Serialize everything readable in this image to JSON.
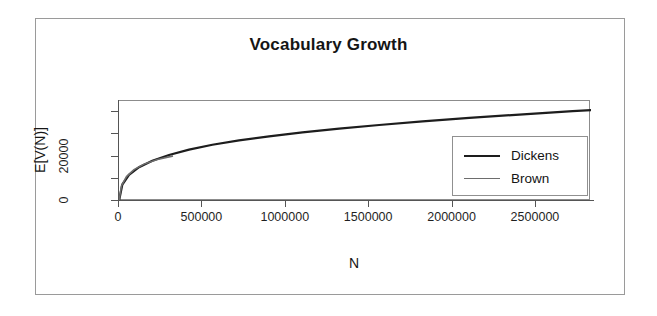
{
  "figure": {
    "title": "Vocabulary Growth",
    "frame_color": "#9a9a9a",
    "background": "#ffffff"
  },
  "chart_data": {
    "type": "line",
    "title": "Vocabulary Growth",
    "xlabel": "N",
    "ylabel": "E[V(N)]",
    "xlim": [
      0,
      2830000
    ],
    "ylim": [
      0,
      45000
    ],
    "grid": false,
    "legend_position": "right",
    "xticks": [
      0,
      500000,
      1000000,
      1500000,
      2000000,
      2500000
    ],
    "xtick_labels": [
      "0",
      "500000",
      "1000000",
      "1500000",
      "2000000",
      "2500000"
    ],
    "yticks": [
      0,
      10000,
      20000,
      30000,
      40000
    ],
    "ytick_labels": [
      "0",
      "",
      "20000",
      "",
      ""
    ],
    "series": [
      {
        "name": "Dickens",
        "color": "#1d1d1d",
        "linewidth": 2.2,
        "x": [
          0,
          20000,
          60000,
          120000,
          200000,
          300000,
          420000,
          560000,
          720000,
          900000,
          1100000,
          1320000,
          1560000,
          1820000,
          2100000,
          2400000,
          2720000,
          2830000
        ],
        "y": [
          0,
          7400,
          11800,
          15200,
          18100,
          20700,
          23100,
          25300,
          27300,
          29100,
          30900,
          32600,
          34200,
          35800,
          37400,
          38900,
          40400,
          40900
        ]
      },
      {
        "name": "Brown",
        "color": "#6d6d6d",
        "linewidth": 1.6,
        "x": [
          0,
          15000,
          45000,
          90000,
          150000,
          230000,
          320000
        ],
        "y": [
          0,
          6900,
          11000,
          14100,
          16600,
          18700,
          20200
        ]
      }
    ],
    "legend_entries": [
      {
        "label": "Dickens",
        "color": "#1d1d1d",
        "style": "solid-thick"
      },
      {
        "label": "Brown",
        "color": "#6d6d6d",
        "style": "solid-thin"
      }
    ]
  },
  "axes": {
    "x_title": "N",
    "y_title": "E[V(N)]",
    "x_tick_labels": [
      "0",
      "500000",
      "1000000",
      "1500000",
      "2000000",
      "2500000"
    ],
    "y_tick_labels": [
      "0",
      "20000"
    ]
  }
}
